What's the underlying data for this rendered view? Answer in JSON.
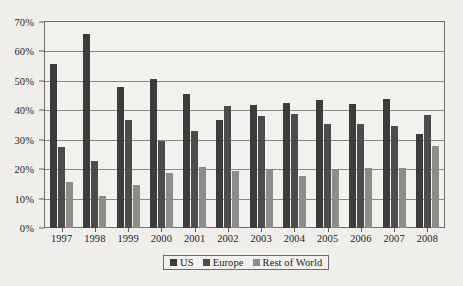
{
  "chart_data": {
    "type": "bar",
    "title": "",
    "subtitle": "",
    "xlabel": "",
    "ylabel": "",
    "ylim": [
      0,
      70
    ],
    "ytick_labels": [
      "0%",
      "10%",
      "20%",
      "30%",
      "40%",
      "50%",
      "60%",
      "70%"
    ],
    "ytick_values": [
      0,
      10,
      20,
      30,
      40,
      50,
      60,
      70
    ],
    "grid": true,
    "legend_position": "bottom",
    "categories": [
      "1997",
      "1998",
      "1999",
      "2000",
      "2001",
      "2002",
      "2003",
      "2004",
      "2005",
      "2006",
      "2007",
      "2008"
    ],
    "series": [
      {
        "name": "US",
        "color": "#3c3c3c",
        "values": [
          55.7,
          66.0,
          47.8,
          50.7,
          45.5,
          36.8,
          41.8,
          42.6,
          43.5,
          42.3,
          43.8,
          32.0
        ]
      },
      {
        "name": "Europe",
        "color": "#4d4c4c",
        "values": [
          27.5,
          22.7,
          36.6,
          29.5,
          32.8,
          41.6,
          38.0,
          38.6,
          35.5,
          35.2,
          34.5,
          38.5
        ]
      },
      {
        "name": "Rest of World",
        "color": "#8d8c89",
        "values": [
          15.7,
          10.8,
          14.5,
          18.7,
          20.6,
          19.5,
          19.8,
          17.6,
          19.8,
          20.3,
          20.5,
          28.0
        ]
      }
    ]
  },
  "legend": {
    "items": [
      {
        "label": "US",
        "color": "#3c3c3c"
      },
      {
        "label": "Europe",
        "color": "#4d4c4c"
      },
      {
        "label": "Rest of World",
        "color": "#8d8c89"
      }
    ]
  },
  "colors": {
    "background": "#efeeea",
    "plot_background": "#f2f1ed",
    "axis": "#6e6c68",
    "gridline": "#8b8984",
    "text": "#1d1c1a"
  }
}
